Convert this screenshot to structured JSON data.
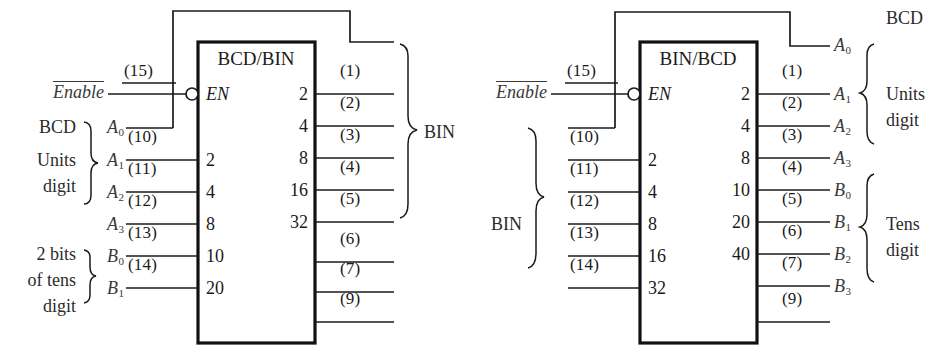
{
  "figure": {
    "kind": "logic-block-diagram",
    "stroke_color": "#1a1a1a",
    "text_color": "#2b2b2b",
    "background": "#ffffff"
  },
  "blocks": [
    {
      "id": "bcd-to-bin",
      "title": "BCD/BIN",
      "enable": {
        "label": "Enable",
        "overbar": true,
        "pin": "(15)",
        "inner_label": "EN",
        "bubble": true
      },
      "left_group_labels": [
        {
          "text": "BCD",
          "sub": ""
        },
        {
          "text": "Units",
          "sub": ""
        },
        {
          "text": "digit",
          "sub": ""
        }
      ],
      "left_groups": [
        {
          "name": "BCD Units digit",
          "lines": [
            "BCD",
            "Units",
            "digit"
          ]
        },
        {
          "name": "2 bits of tens digit",
          "lines": [
            "2 bits",
            "of tens",
            "digit"
          ]
        }
      ],
      "inputs": [
        {
          "signal": "A",
          "sub": "0",
          "pin": "",
          "weight": "",
          "feedback": true
        },
        {
          "signal": "A",
          "sub": "1",
          "pin": "(10)",
          "weight": "2"
        },
        {
          "signal": "A",
          "sub": "2",
          "pin": "(11)",
          "weight": "4"
        },
        {
          "signal": "A",
          "sub": "3",
          "pin": "(12)",
          "weight": "8"
        },
        {
          "signal": "B",
          "sub": "0",
          "pin": "(13)",
          "weight": "10"
        },
        {
          "signal": "B",
          "sub": "1",
          "pin": "(14)",
          "weight": "20"
        }
      ],
      "outputs": [
        {
          "pin": "(1)",
          "weight": "2"
        },
        {
          "pin": "(2)",
          "weight": "4"
        },
        {
          "pin": "(3)",
          "weight": "8"
        },
        {
          "pin": "(4)",
          "weight": "16"
        },
        {
          "pin": "(5)",
          "weight": "32"
        },
        {
          "pin": "(6)",
          "weight": ""
        },
        {
          "pin": "(7)",
          "weight": ""
        },
        {
          "pin": "(9)",
          "weight": ""
        }
      ],
      "right_group_label": "BIN"
    },
    {
      "id": "bin-to-bcd",
      "title": "BIN/BCD",
      "enable": {
        "label": "Enable",
        "overbar": true,
        "pin": "(15)",
        "inner_label": "EN",
        "bubble": true
      },
      "left_group_label": "BIN",
      "inputs": [
        {
          "signal": "",
          "sub": "",
          "pin": "",
          "weight": "",
          "feedback": true
        },
        {
          "signal": "",
          "sub": "",
          "pin": "(10)",
          "weight": "2"
        },
        {
          "signal": "",
          "sub": "",
          "pin": "(11)",
          "weight": "4"
        },
        {
          "signal": "",
          "sub": "",
          "pin": "(12)",
          "weight": "8"
        },
        {
          "signal": "",
          "sub": "",
          "pin": "(13)",
          "weight": "16"
        },
        {
          "signal": "",
          "sub": "",
          "pin": "(14)",
          "weight": "32"
        }
      ],
      "outputs": [
        {
          "pin": "",
          "weight": "",
          "signal": "A",
          "sub": "0",
          "feedback": true
        },
        {
          "pin": "(1)",
          "weight": "2",
          "signal": "A",
          "sub": "1"
        },
        {
          "pin": "(2)",
          "weight": "4",
          "signal": "A",
          "sub": "2"
        },
        {
          "pin": "(3)",
          "weight": "8",
          "signal": "A",
          "sub": "3"
        },
        {
          "pin": "(4)",
          "weight": "10",
          "signal": "B",
          "sub": "0"
        },
        {
          "pin": "(5)",
          "weight": "20",
          "signal": "B",
          "sub": "1"
        },
        {
          "pin": "(6)",
          "weight": "40",
          "signal": "B",
          "sub": "2"
        },
        {
          "pin": "(7)",
          "weight": "",
          "signal": "B",
          "sub": "3"
        },
        {
          "pin": "(9)",
          "weight": "",
          "signal": "",
          "sub": ""
        }
      ],
      "right_group_labels": [
        {
          "name": "bcd-top",
          "lines": [
            "BCD"
          ]
        },
        {
          "name": "units-digit",
          "lines": [
            "Units",
            "digit"
          ]
        },
        {
          "name": "tens-digit",
          "lines": [
            "Tens",
            "digit"
          ]
        }
      ]
    }
  ],
  "text": {
    "bcd": "BCD",
    "bin": "BIN",
    "units": "Units",
    "digit": "digit",
    "tens": "Tens",
    "two_bits": "2 bits",
    "of_tens": "of tens",
    "enable": "Enable",
    "en": "EN",
    "title_left": "BCD/BIN",
    "title_right": "BIN/BCD",
    "pin1": "(1)",
    "pin2": "(2)",
    "pin3": "(3)",
    "pin4": "(4)",
    "pin5": "(5)",
    "pin6": "(6)",
    "pin7": "(7)",
    "pin9": "(9)",
    "pin10": "(10)",
    "pin11": "(11)",
    "pin12": "(12)",
    "pin13": "(13)",
    "pin14": "(14)",
    "pin15": "(15)",
    "w2": "2",
    "w4": "4",
    "w8": "8",
    "w10": "10",
    "w16": "16",
    "w20": "20",
    "w32": "32",
    "w40": "40",
    "A": "A",
    "B": "B",
    "s0": "0",
    "s1": "1",
    "s2": "2",
    "s3": "3"
  }
}
